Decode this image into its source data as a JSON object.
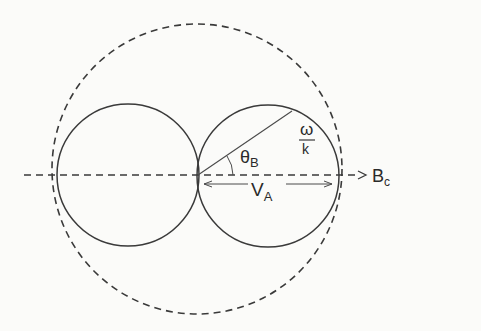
{
  "diagram": {
    "labels": {
      "field": "B",
      "field_sub": "c",
      "angle": "θ",
      "angle_sub": "B",
      "velocity": "V",
      "velocity_sub": "A",
      "phase_num": "ω",
      "phase_den": "k"
    },
    "colors": {
      "stroke": "#3a3a3a",
      "background": "#fbfbf9"
    },
    "geometry": {
      "left_circle": {
        "cx": 128,
        "cy": 175,
        "r": 71
      },
      "right_circle": {
        "cx": 268,
        "cy": 175,
        "r": 71
      },
      "outer_dashed_circle": {
        "cx": 197,
        "cy": 169,
        "r": 145
      },
      "axis_y": 175
    }
  }
}
